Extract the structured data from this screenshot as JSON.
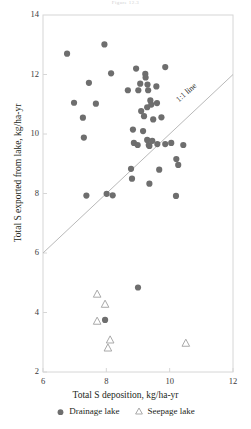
{
  "figure": {
    "title": "Figure 12.3",
    "plot_box": {
      "left": 43,
      "top": 15,
      "right": 233,
      "bottom": 372
    }
  },
  "axes": {
    "x": {
      "label": "Total S deposition, kg/ha-yr",
      "ticks": [
        6,
        8,
        10,
        12
      ],
      "min": 6,
      "max": 12
    },
    "y": {
      "label": "Total S exported from lake, kg/ha-yr",
      "ticks": [
        2,
        4,
        6,
        8,
        10,
        12,
        14
      ],
      "min": 2,
      "max": 14
    }
  },
  "annotations": [
    {
      "name": "one-to-one-line-label",
      "text": "1:1 line"
    }
  ],
  "legend": {
    "items": [
      {
        "label": "Drainage lake",
        "marker": "filled-circle",
        "color": "#6e6e6e"
      },
      {
        "label": "Seepage lake",
        "marker": "open-triangle",
        "color": "#a9a9a9"
      }
    ]
  },
  "colors": {
    "drainage": "#6e6e6e",
    "seepage": "#a9a9a9",
    "frame": "#d6d6d6",
    "line": "#b9b9b9",
    "text": "#231f20"
  },
  "chart_data": {
    "type": "scatter",
    "title": "Figure 12.3",
    "xlabel": "Total S deposition, kg/ha-yr",
    "ylabel": "Total S exported from lake, kg/ha-yr",
    "xlim": [
      6,
      12
    ],
    "ylim": [
      2,
      14
    ],
    "xticks": [
      6,
      8,
      10,
      12
    ],
    "yticks": [
      2,
      4,
      6,
      8,
      10,
      12,
      14
    ],
    "grid": false,
    "legend_position": "bottom",
    "reference_line": {
      "name": "1:1 line",
      "slope": 1,
      "intercept": 0,
      "x_from": 6,
      "x_to": 12
    },
    "series": [
      {
        "name": "Drainage lake",
        "marker": "filled-circle",
        "color": "#6e6e6e",
        "points": [
          [
            6.76,
            12.7
          ],
          [
            7.45,
            11.72
          ],
          [
            8.15,
            12.04
          ],
          [
            7.94,
            13.01
          ],
          [
            8.94,
            12.2
          ],
          [
            9.23,
            12.02
          ],
          [
            9.07,
            11.69
          ],
          [
            9.3,
            11.66
          ],
          [
            9.86,
            12.25
          ],
          [
            8.68,
            11.47
          ],
          [
            9.01,
            11.47
          ],
          [
            9.32,
            11.47
          ],
          [
            9.58,
            11.6
          ],
          [
            9.39,
            11.13
          ],
          [
            9.1,
            10.77
          ],
          [
            9.29,
            10.9
          ],
          [
            9.19,
            10.6
          ],
          [
            9.42,
            10.99
          ],
          [
            9.16,
            10.1
          ],
          [
            9.29,
            9.8
          ],
          [
            9.45,
            9.77
          ],
          [
            8.87,
            9.7
          ],
          [
            9.34,
            9.63
          ],
          [
            9.61,
            9.66
          ],
          [
            9.36,
            9.6
          ],
          [
            6.98,
            11.05
          ],
          [
            7.67,
            11.02
          ],
          [
            7.26,
            10.55
          ],
          [
            7.29,
            9.88
          ],
          [
            8.99,
            9.63
          ],
          [
            9.86,
            9.66
          ],
          [
            10.05,
            9.7
          ],
          [
            10.43,
            9.63
          ],
          [
            10.21,
            9.16
          ],
          [
            10.27,
            8.96
          ],
          [
            8.78,
            8.83
          ],
          [
            8.81,
            8.5
          ],
          [
            9.36,
            8.33
          ],
          [
            10.2,
            7.92
          ],
          [
            7.37,
            7.93
          ],
          [
            8.01,
            7.99
          ],
          [
            8.2,
            7.94
          ],
          [
            9.67,
            8.8
          ],
          [
            9.48,
            10.49
          ],
          [
            9.74,
            10.56
          ],
          [
            9.24,
            11.9
          ],
          [
            8.84,
            10.15
          ],
          [
            9.6,
            11.04
          ],
          [
            9.0,
            4.84
          ],
          [
            7.96,
            3.75
          ]
        ]
      },
      {
        "name": "Seepage lake",
        "marker": "open-triangle",
        "color": "#a9a9a9",
        "points": [
          [
            7.71,
            4.62
          ],
          [
            7.96,
            4.28
          ],
          [
            7.71,
            3.71
          ],
          [
            8.12,
            3.08
          ],
          [
            8.05,
            2.81
          ],
          [
            10.51,
            2.97
          ]
        ]
      }
    ]
  }
}
